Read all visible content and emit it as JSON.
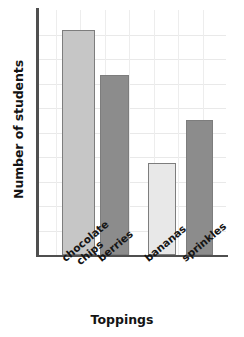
{
  "chart_data": {
    "type": "bar",
    "title": "",
    "xlabel": "Toppings",
    "ylabel": "Number of students",
    "categories": [
      "chocolate chips",
      "berries",
      "bananas",
      "sprinkles"
    ],
    "category_lines": [
      [
        "chocolate",
        "chips"
      ],
      [
        "berries"
      ],
      [
        "bananas"
      ],
      [
        "sprinkles"
      ]
    ],
    "values": [
      9.2,
      7.3,
      3.8,
      5.5
    ],
    "ylim": [
      0,
      10
    ],
    "y_tick_count": 10,
    "y_tick_labels_visible": false,
    "grid": true,
    "grid_horizontal": true,
    "grid_vertical": true,
    "legend": "none",
    "bar_colors": [
      "#c6c6c6",
      "#8c8c8c",
      "#e8e8e8",
      "#8c8c8c"
    ],
    "bar_edge_color": "#7d7d7d",
    "axis_color": "#4f4f4f",
    "grid_color": "#e9e9e9",
    "background": "#ffffff"
  },
  "axes": {
    "y_title": "Number of students",
    "x_title": "Toppings"
  },
  "bars": [
    {
      "label": "chocolate chips",
      "value": 9.2,
      "color": "#c6c6c6",
      "left_pct": 12.8,
      "width_pct": 17.6,
      "height_pct": 91.8
    },
    {
      "label": "berries",
      "value": 7.3,
      "color": "#8c8c8c",
      "left_pct": 33.0,
      "width_pct": 15.4,
      "height_pct": 73.5
    },
    {
      "label": "bananas",
      "value": 3.8,
      "color": "#e8e8e8",
      "left_pct": 58.5,
      "width_pct": 14.9,
      "height_pct": 37.6
    },
    {
      "label": "sprinkles",
      "value": 5.5,
      "color": "#8c8c8c",
      "left_pct": 78.7,
      "width_pct": 14.4,
      "height_pct": 55.1
    }
  ],
  "gridlines": {
    "horizontal_pct": [
      10,
      20,
      30,
      40,
      50,
      60,
      70,
      80,
      90
    ],
    "vertical_pct": [
      9.5,
      22.5,
      35.5,
      48.5,
      61.5,
      74.5,
      87.5
    ]
  }
}
